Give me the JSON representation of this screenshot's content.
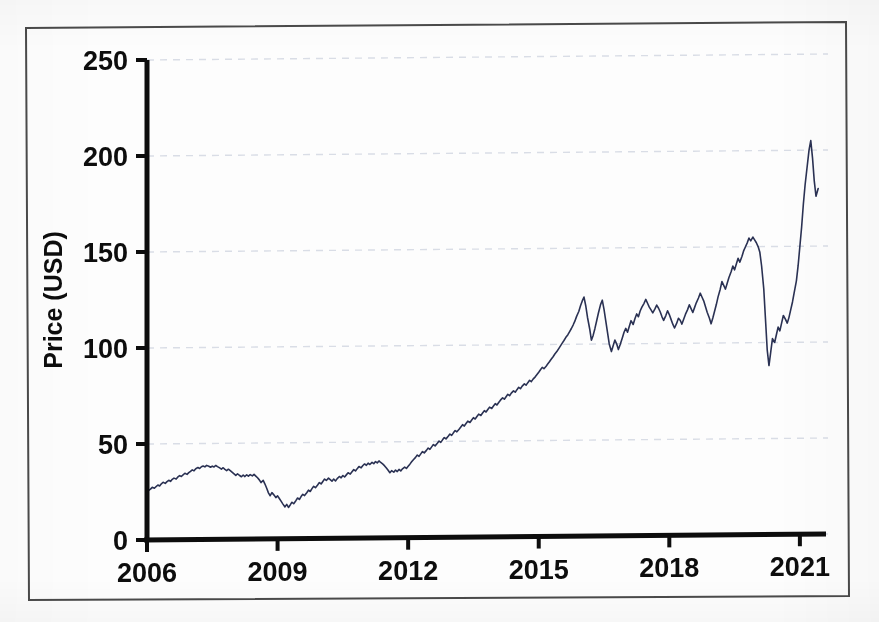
{
  "figure": {
    "background_color": "#fdfdfd",
    "frame_color": "#4a4a4a",
    "axis_color": "#0d0d0d",
    "grid_color": "#d9dde6",
    "series_color": "#2a3153"
  },
  "chart_data": {
    "type": "line",
    "title": "",
    "subtitle": "",
    "xlabel": "",
    "ylabel": "Price (USD)",
    "xlim": [
      2006,
      2021.6
    ],
    "ylim": [
      0,
      250
    ],
    "grid": true,
    "grid_axis": "y",
    "legend": false,
    "legend_position": "none",
    "xtick_labels": [
      "2006",
      "2009",
      "2012",
      "2015",
      "2018",
      "2021"
    ],
    "xtick_values": [
      2006,
      2009,
      2012,
      2015,
      2018,
      2021
    ],
    "ytick_labels": [
      "0",
      "50",
      "100",
      "150",
      "200",
      "250"
    ],
    "ytick_values": [
      0,
      50,
      100,
      150,
      200,
      250
    ],
    "annotations": [],
    "series": [
      {
        "name": "Price (USD)",
        "color": "#2a3153",
        "linewidth": 1.6,
        "x": [
          2006.0,
          2006.04,
          2006.08,
          2006.12,
          2006.17,
          2006.21,
          2006.25,
          2006.29,
          2006.33,
          2006.37,
          2006.42,
          2006.46,
          2006.5,
          2006.54,
          2006.58,
          2006.62,
          2006.67,
          2006.71,
          2006.75,
          2006.79,
          2006.83,
          2006.87,
          2006.92,
          2006.96,
          2007.0,
          2007.04,
          2007.08,
          2007.12,
          2007.17,
          2007.21,
          2007.25,
          2007.29,
          2007.33,
          2007.37,
          2007.42,
          2007.46,
          2007.5,
          2007.54,
          2007.58,
          2007.62,
          2007.67,
          2007.71,
          2007.75,
          2007.79,
          2007.83,
          2007.87,
          2007.92,
          2007.96,
          2008.0,
          2008.04,
          2008.08,
          2008.12,
          2008.17,
          2008.21,
          2008.25,
          2008.29,
          2008.33,
          2008.37,
          2008.42,
          2008.46,
          2008.5,
          2008.54,
          2008.58,
          2008.62,
          2008.67,
          2008.71,
          2008.75,
          2008.79,
          2008.83,
          2008.87,
          2008.92,
          2008.96,
          2009.0,
          2009.04,
          2009.08,
          2009.12,
          2009.17,
          2009.21,
          2009.25,
          2009.29,
          2009.33,
          2009.37,
          2009.42,
          2009.46,
          2009.5,
          2009.54,
          2009.58,
          2009.62,
          2009.67,
          2009.71,
          2009.75,
          2009.79,
          2009.83,
          2009.87,
          2009.92,
          2009.96,
          2010.0,
          2010.04,
          2010.08,
          2010.12,
          2010.17,
          2010.21,
          2010.25,
          2010.29,
          2010.33,
          2010.37,
          2010.42,
          2010.46,
          2010.5,
          2010.54,
          2010.58,
          2010.62,
          2010.67,
          2010.71,
          2010.75,
          2010.79,
          2010.83,
          2010.87,
          2010.92,
          2010.96,
          2011.0,
          2011.04,
          2011.08,
          2011.12,
          2011.17,
          2011.21,
          2011.25,
          2011.29,
          2011.33,
          2011.37,
          2011.42,
          2011.46,
          2011.5,
          2011.54,
          2011.58,
          2011.62,
          2011.67,
          2011.71,
          2011.75,
          2011.79,
          2011.83,
          2011.87,
          2011.92,
          2011.96,
          2012.0,
          2012.04,
          2012.08,
          2012.12,
          2012.17,
          2012.21,
          2012.25,
          2012.29,
          2012.33,
          2012.37,
          2012.42,
          2012.46,
          2012.5,
          2012.54,
          2012.58,
          2012.62,
          2012.67,
          2012.71,
          2012.75,
          2012.79,
          2012.83,
          2012.87,
          2012.92,
          2012.96,
          2013.0,
          2013.04,
          2013.08,
          2013.12,
          2013.17,
          2013.21,
          2013.25,
          2013.29,
          2013.33,
          2013.37,
          2013.42,
          2013.46,
          2013.5,
          2013.54,
          2013.58,
          2013.62,
          2013.67,
          2013.71,
          2013.75,
          2013.79,
          2013.83,
          2013.87,
          2013.92,
          2013.96,
          2014.0,
          2014.04,
          2014.08,
          2014.12,
          2014.17,
          2014.21,
          2014.25,
          2014.29,
          2014.33,
          2014.37,
          2014.42,
          2014.46,
          2014.5,
          2014.54,
          2014.58,
          2014.62,
          2014.67,
          2014.71,
          2014.75,
          2014.79,
          2014.83,
          2014.87,
          2014.92,
          2014.96,
          2015.0,
          2015.04,
          2015.08,
          2015.12,
          2015.17,
          2015.21,
          2015.25,
          2015.29,
          2015.33,
          2015.37,
          2015.42,
          2015.46,
          2015.5,
          2015.54,
          2015.58,
          2015.62,
          2015.67,
          2015.71,
          2015.75,
          2015.79,
          2015.83,
          2015.87,
          2015.92,
          2015.96,
          2016.0,
          2016.04,
          2016.08,
          2016.12,
          2016.17,
          2016.21,
          2016.25,
          2016.29,
          2016.33,
          2016.37,
          2016.42,
          2016.46,
          2016.5,
          2016.54,
          2016.58,
          2016.62,
          2016.67,
          2016.71,
          2016.75,
          2016.79,
          2016.83,
          2016.87,
          2016.92,
          2016.96,
          2017.0,
          2017.04,
          2017.08,
          2017.12,
          2017.17,
          2017.21,
          2017.25,
          2017.29,
          2017.33,
          2017.37,
          2017.42,
          2017.46,
          2017.5,
          2017.54,
          2017.58,
          2017.62,
          2017.67,
          2017.71,
          2017.75,
          2017.79,
          2017.83,
          2017.87,
          2017.92,
          2017.96,
          2018.0,
          2018.04,
          2018.08,
          2018.12,
          2018.17,
          2018.21,
          2018.25,
          2018.29,
          2018.33,
          2018.37,
          2018.42,
          2018.46,
          2018.5,
          2018.54,
          2018.58,
          2018.62,
          2018.67,
          2018.71,
          2018.75,
          2018.79,
          2018.83,
          2018.87,
          2018.92,
          2018.96,
          2019.0,
          2019.04,
          2019.08,
          2019.12,
          2019.17,
          2019.21,
          2019.25,
          2019.29,
          2019.33,
          2019.37,
          2019.42,
          2019.46,
          2019.5,
          2019.54,
          2019.58,
          2019.62,
          2019.67,
          2019.71,
          2019.75,
          2019.79,
          2019.83,
          2019.87,
          2019.92,
          2019.96,
          2020.0,
          2020.04,
          2020.08,
          2020.12,
          2020.17,
          2020.21,
          2020.25,
          2020.29,
          2020.33,
          2020.37,
          2020.42,
          2020.46,
          2020.5,
          2020.54,
          2020.58,
          2020.62,
          2020.67,
          2020.71,
          2020.75,
          2020.79,
          2020.83,
          2020.87,
          2020.92,
          2020.96,
          2021.0,
          2021.04,
          2021.08,
          2021.12,
          2021.17,
          2021.21,
          2021.25,
          2021.29,
          2021.33,
          2021.37,
          2021.42
        ],
        "y": [
          25.0,
          25.8,
          26.5,
          27.4,
          26.9,
          27.8,
          28.6,
          28.1,
          29.2,
          30.0,
          29.4,
          30.3,
          31.0,
          30.4,
          31.5,
          32.1,
          31.6,
          32.7,
          33.4,
          32.9,
          33.8,
          34.6,
          34.0,
          34.9,
          35.6,
          36.3,
          35.8,
          36.9,
          37.5,
          37.0,
          37.9,
          38.3,
          37.8,
          38.6,
          38.1,
          37.6,
          38.2,
          37.7,
          38.5,
          37.9,
          37.2,
          36.6,
          37.3,
          36.4,
          35.8,
          36.5,
          35.6,
          34.8,
          34.0,
          33.2,
          34.1,
          33.3,
          32.5,
          33.4,
          32.6,
          33.5,
          32.8,
          33.6,
          32.9,
          33.7,
          32.8,
          31.9,
          30.8,
          29.4,
          30.5,
          28.6,
          26.4,
          24.0,
          22.5,
          24.1,
          22.8,
          21.5,
          22.4,
          21.0,
          19.6,
          18.2,
          16.6,
          17.9,
          16.3,
          17.6,
          19.0,
          18.2,
          19.8,
          21.2,
          20.4,
          21.9,
          23.1,
          22.4,
          23.9,
          25.2,
          24.5,
          26.0,
          27.2,
          26.5,
          27.9,
          29.1,
          28.4,
          29.7,
          30.9,
          30.2,
          31.4,
          30.6,
          29.8,
          30.9,
          29.9,
          31.1,
          32.2,
          31.5,
          32.7,
          31.9,
          33.0,
          34.1,
          33.4,
          34.6,
          35.7,
          35.0,
          36.2,
          37.3,
          36.6,
          37.8,
          38.6,
          37.9,
          39.0,
          38.3,
          39.4,
          38.7,
          39.8,
          39.1,
          40.1,
          39.3,
          38.4,
          37.5,
          36.4,
          35.2,
          33.9,
          35.0,
          34.2,
          35.3,
          34.5,
          35.6,
          34.8,
          35.9,
          36.8,
          36.1,
          37.2,
          38.3,
          39.5,
          40.6,
          41.8,
          43.0,
          42.3,
          43.6,
          44.8,
          44.1,
          45.4,
          46.6,
          45.9,
          47.2,
          48.4,
          47.7,
          49.0,
          50.2,
          49.5,
          50.8,
          52.0,
          51.3,
          52.6,
          53.8,
          53.1,
          54.4,
          55.6,
          54.9,
          56.2,
          57.4,
          58.6,
          57.9,
          59.2,
          60.4,
          59.7,
          61.0,
          62.2,
          61.5,
          62.8,
          64.0,
          63.3,
          64.6,
          65.8,
          65.1,
          66.4,
          67.6,
          66.9,
          68.2,
          69.4,
          68.7,
          70.0,
          71.2,
          72.4,
          71.7,
          73.0,
          74.2,
          73.5,
          74.8,
          76.0,
          75.3,
          76.6,
          77.8,
          77.1,
          78.4,
          79.6,
          78.9,
          80.2,
          81.4,
          80.7,
          82.0,
          83.2,
          84.4,
          85.6,
          86.9,
          88.1,
          87.4,
          88.7,
          89.9,
          91.1,
          92.4,
          93.6,
          95.0,
          96.4,
          97.8,
          99.2,
          100.6,
          102.0,
          103.5,
          105.0,
          106.6,
          108.2,
          110.0,
          112.0,
          114.5,
          117.0,
          120.0,
          122.5,
          124.5,
          120.0,
          114.0,
          108.0,
          102.0,
          104.5,
          108.0,
          112.0,
          116.0,
          120.5,
          122.8,
          118.0,
          112.0,
          106.0,
          100.0,
          96.0,
          99.0,
          102.0,
          100.0,
          97.0,
          99.5,
          103.0,
          106.0,
          108.0,
          106.0,
          109.0,
          112.0,
          110.0,
          113.0,
          115.5,
          114.0,
          117.0,
          119.0,
          121.0,
          123.0,
          121.0,
          119.0,
          117.5,
          116.0,
          118.0,
          120.0,
          118.5,
          116.5,
          114.0,
          112.0,
          114.5,
          117.0,
          115.0,
          112.5,
          110.0,
          108.0,
          110.5,
          113.0,
          112.0,
          110.0,
          112.5,
          115.0,
          117.5,
          120.0,
          118.0,
          116.0,
          118.5,
          121.0,
          123.5,
          126.0,
          124.0,
          122.0,
          119.0,
          116.0,
          113.0,
          110.0,
          113.0,
          116.5,
          120.0,
          124.0,
          128.0,
          132.0,
          130.0,
          128.0,
          131.0,
          134.0,
          137.0,
          140.0,
          138.0,
          141.0,
          144.0,
          142.0,
          145.0,
          148.0,
          150.0,
          152.0,
          154.5,
          153.0,
          155.0,
          153.5,
          152.0,
          150.0,
          147.0,
          140.0,
          128.0,
          112.0,
          96.0,
          88.0,
          95.0,
          102.0,
          100.0,
          104.0,
          108.0,
          106.0,
          110.0,
          114.0,
          112.0,
          110.0,
          113.0,
          117.0,
          121.0,
          126.0,
          132.0,
          140.0,
          150.0,
          160.0,
          172.0,
          182.0,
          192.0,
          200.0,
          205.0,
          196.0,
          184.0,
          176.0,
          180.0
        ]
      }
    ]
  }
}
